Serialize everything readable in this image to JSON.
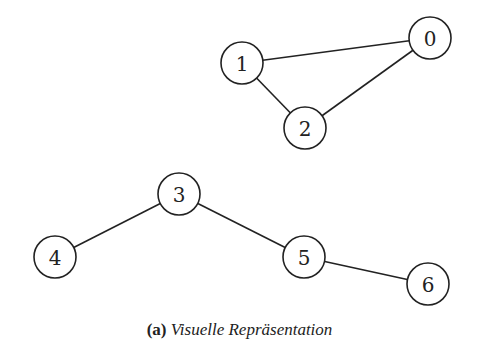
{
  "graph": {
    "nodes": [
      {
        "id": "0",
        "x": 430,
        "y": 38
      },
      {
        "id": "1",
        "x": 242,
        "y": 63
      },
      {
        "id": "2",
        "x": 305,
        "y": 128
      },
      {
        "id": "3",
        "x": 179,
        "y": 194
      },
      {
        "id": "4",
        "x": 55,
        "y": 257
      },
      {
        "id": "5",
        "x": 304,
        "y": 257
      },
      {
        "id": "6",
        "x": 428,
        "y": 284
      }
    ],
    "edges": [
      [
        "1",
        "0"
      ],
      [
        "1",
        "2"
      ],
      [
        "2",
        "0"
      ],
      [
        "3",
        "4"
      ],
      [
        "3",
        "5"
      ],
      [
        "5",
        "6"
      ]
    ],
    "node_radius": 21
  },
  "caption": {
    "label": "(a)",
    "text": "Visuelle Repräsentation"
  }
}
